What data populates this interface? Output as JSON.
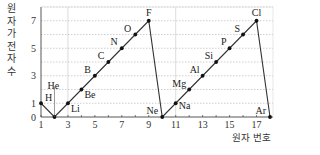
{
  "chart_data": {
    "type": "line",
    "title": "",
    "xlabel": "원자 번호",
    "ylabel": "원자가 전자 수",
    "x": [
      1,
      2,
      3,
      4,
      5,
      6,
      7,
      8,
      9,
      10,
      11,
      12,
      13,
      14,
      15,
      16,
      17,
      18
    ],
    "series": [
      {
        "name": "원자가 전자 수",
        "elements": [
          "H",
          "He",
          "Li",
          "Be",
          "B",
          "C",
          "N",
          "O",
          "F",
          "Ne",
          "Na",
          "Mg",
          "Al",
          "Si",
          "P",
          "S",
          "Cl",
          "Ar"
        ],
        "values": [
          1,
          0,
          1,
          2,
          3,
          4,
          5,
          6,
          7,
          0,
          1,
          2,
          3,
          4,
          5,
          6,
          7,
          0
        ]
      }
    ],
    "x_ticks": [
      "1",
      "3",
      "5",
      "7",
      "9",
      "11",
      "13",
      "15",
      "17"
    ],
    "y_ticks": [
      "0",
      "1",
      "3",
      "5",
      "7"
    ],
    "xlim": [
      1,
      18
    ],
    "ylim": [
      0,
      8
    ],
    "grid": true,
    "legend": null
  },
  "axis": {
    "ylabel_chars": [
      "원",
      "자",
      "가",
      "전",
      "자",
      "수"
    ],
    "xlabel": "원자 번호"
  }
}
